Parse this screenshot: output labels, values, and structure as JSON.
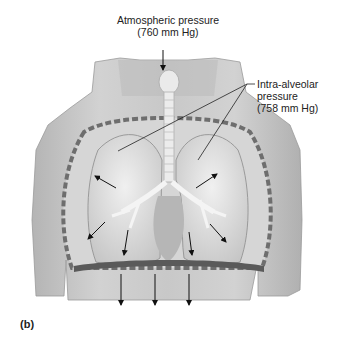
{
  "figure": {
    "panel_label": "(b)",
    "labels": {
      "atmospheric": {
        "line1": "Atmospheric pressure",
        "line2": "(760 mm Hg)"
      },
      "intra_alveolar": {
        "line1": "Intra-alveolar",
        "line2": "pressure",
        "line3": "(758 mm Hg)"
      }
    },
    "colors": {
      "skin": "#c9c9c9",
      "lung": "#e4e4e4",
      "ribs": "#6e6e6e",
      "arrows": "#111111"
    }
  }
}
